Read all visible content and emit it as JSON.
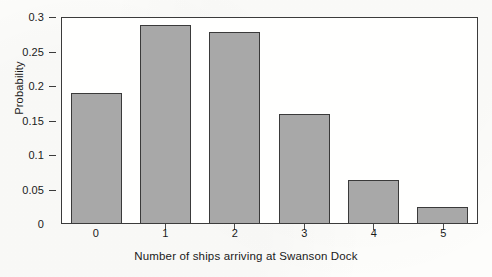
{
  "chart_data": {
    "type": "bar",
    "title": "",
    "xlabel": "Number of ships arriving at Swanson Dock",
    "ylabel": "Probability",
    "categories": [
      "0",
      "1",
      "2",
      "3",
      "4",
      "5"
    ],
    "values": [
      0.19,
      0.29,
      0.28,
      0.16,
      0.063,
      0.023
    ],
    "ylim": [
      0,
      0.3
    ],
    "xlim": [
      -0.5,
      5.5
    ],
    "yticks": [
      "0",
      "0.05",
      "0.1",
      "0.15",
      "0.2",
      "0.25",
      "0.3"
    ],
    "ytick_values": [
      0,
      0.05,
      0.1,
      0.15,
      0.2,
      0.25,
      0.3
    ],
    "grid": false,
    "legend": false,
    "legend_position": "none",
    "bar_fill_color": "#a8a8a8",
    "bar_edge_color": "#3a3a3a",
    "frame_color": "#3b3b3b",
    "background_color": "#fdfdfb"
  }
}
